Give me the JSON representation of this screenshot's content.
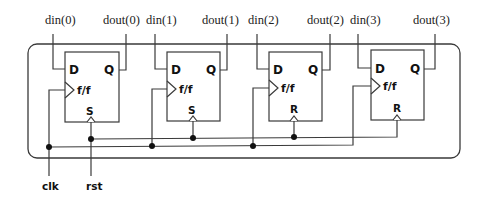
{
  "diagram": {
    "type": "register-circuit",
    "inputs": [
      "din(0)",
      "din(1)",
      "din(2)",
      "din(3)"
    ],
    "outputs": [
      "dout(0)",
      "dout(1)",
      "dout(2)",
      "dout(3)"
    ],
    "flipflops": [
      {
        "d": "D",
        "q": "Q",
        "label": "f/f",
        "ctrl": "S"
      },
      {
        "d": "D",
        "q": "Q",
        "label": "f/f",
        "ctrl": "S"
      },
      {
        "d": "D",
        "q": "Q",
        "label": "f/f",
        "ctrl": "R"
      },
      {
        "d": "D",
        "q": "Q",
        "label": "f/f",
        "ctrl": "R"
      }
    ],
    "clk_label": "clk",
    "rst_label": "rst",
    "colors": {
      "line": "#3a3a3a",
      "dot": "#111111",
      "background": "#ffffff"
    }
  }
}
